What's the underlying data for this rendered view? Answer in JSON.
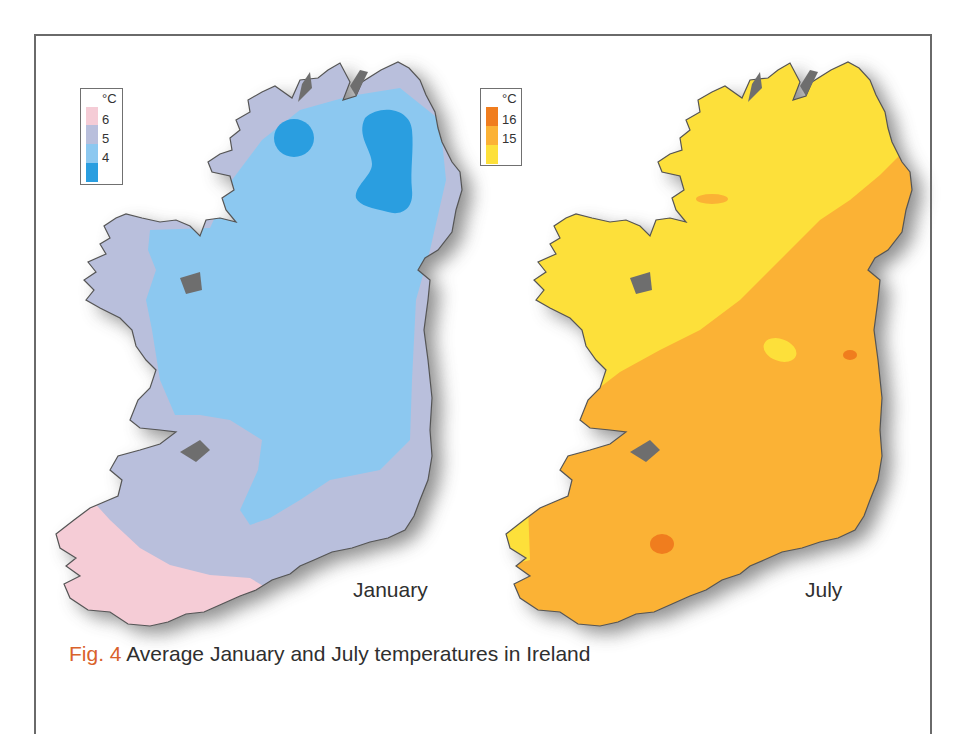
{
  "figure": {
    "caption_prefix": "Fig. 4",
    "caption_text": " Average January and July temperatures in Ireland"
  },
  "maps": [
    {
      "id": "january",
      "label": "January",
      "legend": {
        "unit": "°C",
        "ticks": [
          "6",
          "5",
          "4"
        ],
        "bands": [
          {
            "range": "> 6",
            "color": "#f5ccd6"
          },
          {
            "range": "5 – 6",
            "color": "#b9bfdc"
          },
          {
            "range": "4 – 5",
            "color": "#8cc8f0"
          },
          {
            "range": "< 4",
            "color": "#2a9ee0"
          }
        ]
      },
      "regions": [
        {
          "zone": "south-west coast",
          "band": "> 6"
        },
        {
          "zone": "west & south coasts",
          "band": "5 – 6"
        },
        {
          "zone": "midlands & north",
          "band": "4 – 5"
        },
        {
          "zone": "north (Donegal uplands, Antrim/Sperrins)",
          "band": "< 4"
        }
      ]
    },
    {
      "id": "july",
      "label": "July",
      "legend": {
        "unit": "°C",
        "ticks": [
          "16",
          "15"
        ],
        "bands": [
          {
            "range": "> 16",
            "color": "#f07d1e"
          },
          {
            "range": "15 – 16",
            "color": "#fbb235"
          },
          {
            "range": "< 15",
            "color": "#fde03a"
          }
        ]
      },
      "regions": [
        {
          "zone": "north-west & west",
          "band": "< 15"
        },
        {
          "zone": "south & east",
          "band": "15 – 16"
        },
        {
          "zone": "Dublin coast, near Cork",
          "band": "> 16"
        }
      ]
    }
  ],
  "colors": {
    "caption_accent": "#d9622b",
    "frame": "#6a6a6a",
    "coast_outline": "#555555",
    "shadow": "#7d7d7d"
  }
}
